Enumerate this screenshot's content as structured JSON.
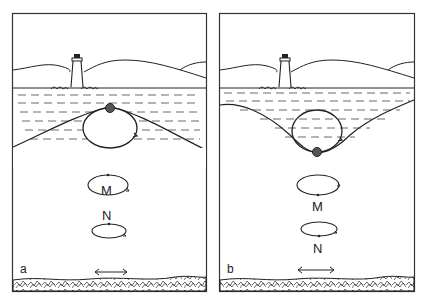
{
  "figure": {
    "panels": [
      {
        "id": "a",
        "label": "a",
        "position": "crest",
        "orbit_labels": [
          "M",
          "N"
        ]
      },
      {
        "id": "b",
        "label": "b",
        "position": "trough",
        "orbit_labels": [
          "M",
          "N"
        ]
      }
    ],
    "colors": {
      "ink": "#222222",
      "background": "#ffffff"
    },
    "icons": [
      "lighthouse-icon",
      "float-ball-icon",
      "double-arrow-icon",
      "seabed-rocks"
    ]
  }
}
